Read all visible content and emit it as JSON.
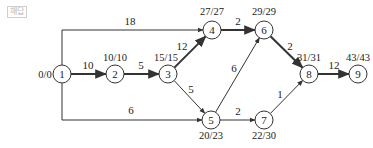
{
  "tag": {
    "label": "해답"
  },
  "nodes": [
    {
      "id": "1",
      "label": "1",
      "x": 62,
      "y": 74,
      "times": "0/0",
      "tx": 45,
      "ty": 78,
      "anchor": "middle"
    },
    {
      "id": "2",
      "label": "2",
      "x": 115,
      "y": 74,
      "times": "10/10",
      "tx": 115,
      "ty": 61,
      "anchor": "middle"
    },
    {
      "id": "3",
      "label": "3",
      "x": 168,
      "y": 74,
      "times": "15/15",
      "tx": 166,
      "ty": 61,
      "anchor": "middle"
    },
    {
      "id": "4",
      "label": "4",
      "x": 212,
      "y": 30,
      "times": "27/27",
      "tx": 212,
      "ty": 15,
      "anchor": "middle"
    },
    {
      "id": "5",
      "label": "5",
      "x": 211,
      "y": 120,
      "times": "20/23",
      "tx": 211,
      "ty": 139,
      "anchor": "middle"
    },
    {
      "id": "6",
      "label": "6",
      "x": 264,
      "y": 30,
      "times": "29/29",
      "tx": 264,
      "ty": 15,
      "anchor": "middle"
    },
    {
      "id": "7",
      "label": "7",
      "x": 264,
      "y": 120,
      "times": "22/30",
      "tx": 264,
      "ty": 139,
      "anchor": "middle"
    },
    {
      "id": "8",
      "label": "8",
      "x": 309,
      "y": 74,
      "times": "31/31",
      "tx": 309,
      "ty": 61,
      "anchor": "middle"
    },
    {
      "id": "9",
      "label": "9",
      "x": 358,
      "y": 74,
      "times": "43/43",
      "tx": 358,
      "ty": 61,
      "anchor": "middle"
    }
  ],
  "edges": [
    {
      "from": "1",
      "to": "2",
      "weight": "10",
      "critical": true,
      "lx": 88,
      "ly": 69
    },
    {
      "from": "2",
      "to": "3",
      "weight": "5",
      "critical": true,
      "lx": 141,
      "ly": 69
    },
    {
      "from": "3",
      "to": "4",
      "weight": "12",
      "critical": true,
      "lx": 182,
      "ly": 50
    },
    {
      "from": "1",
      "to": "4",
      "weight": "18",
      "critical": false,
      "lx": 130,
      "ly": 25,
      "path": "M62,65 L62,30 L203,30"
    },
    {
      "from": "3",
      "to": "5",
      "weight": "5",
      "critical": false,
      "lx": 191,
      "ly": 93
    },
    {
      "from": "1",
      "to": "5",
      "weight": "6",
      "critical": false,
      "lx": 131,
      "ly": 114,
      "path": "M62,83 L62,120 L202,120"
    },
    {
      "from": "4",
      "to": "6",
      "weight": "2",
      "critical": true,
      "lx": 238,
      "ly": 25
    },
    {
      "from": "5",
      "to": "6",
      "weight": "6",
      "critical": false,
      "lx": 234,
      "ly": 72
    },
    {
      "from": "5",
      "to": "7",
      "weight": "2",
      "critical": false,
      "lx": 238,
      "ly": 115
    },
    {
      "from": "6",
      "to": "8",
      "weight": "2",
      "critical": true,
      "lx": 290,
      "ly": 50
    },
    {
      "from": "7",
      "to": "8",
      "weight": "1",
      "critical": false,
      "lx": 280,
      "ly": 98
    },
    {
      "from": "8",
      "to": "9",
      "weight": "12",
      "critical": true,
      "lx": 334,
      "ly": 69
    }
  ],
  "style": {
    "line_color": "#333333",
    "node_fill": "#ffffff",
    "tag_color": "#b8b8b8"
  }
}
